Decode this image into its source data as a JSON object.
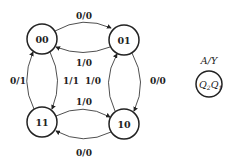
{
  "diagram": {
    "type": "state-diagram",
    "states": [
      {
        "id": "00",
        "label": "00"
      },
      {
        "id": "01",
        "label": "01"
      },
      {
        "id": "10",
        "label": "10"
      },
      {
        "id": "11",
        "label": "11"
      }
    ],
    "transitions": [
      {
        "from": "00",
        "to": "01",
        "label": "0/0"
      },
      {
        "from": "01",
        "to": "00",
        "label": "1/0"
      },
      {
        "from": "01",
        "to": "10",
        "label": "0/0"
      },
      {
        "from": "10",
        "to": "01",
        "label": "1/0"
      },
      {
        "from": "10",
        "to": "11",
        "label": "0/0"
      },
      {
        "from": "11",
        "to": "10",
        "label": "1/0"
      },
      {
        "from": "11",
        "to": "00",
        "label": "0/1"
      },
      {
        "from": "00",
        "to": "11",
        "label": "1/1"
      }
    ],
    "legend": {
      "label": "A/Y",
      "state_text": "Q",
      "sub2": "2",
      "sub1": "1"
    }
  }
}
